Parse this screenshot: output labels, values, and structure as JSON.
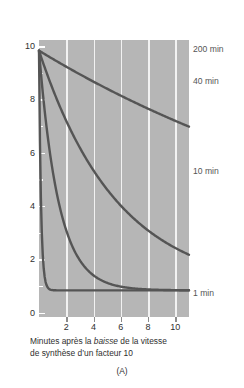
{
  "chart_data": {
    "type": "line",
    "title": "",
    "subtitle": "",
    "panel_letter": "(A)",
    "xlabel_line1_pre": "Minutes après la ",
    "xlabel_line1_emph": "baisse",
    "xlabel_line1_post": " de la vitesse",
    "xlabel_line2": "de synthèse d’un facteur 10",
    "xlabel_full": "Minutes après la baisse de la vitesse de synthèse d’un facteur 10",
    "ylabel": "Concentration relative des molécules intracellulaires",
    "xlim": [
      0,
      11
    ],
    "ylim": [
      0,
      10.4
    ],
    "x_ticks": [
      2,
      4,
      6,
      8,
      10
    ],
    "x_tick_labels": [
      "2",
      "4",
      "6",
      "8",
      "10"
    ],
    "y_ticks": [
      0,
      2,
      4,
      6,
      8,
      10
    ],
    "y_tick_labels": [
      "0",
      "2",
      "4",
      "6",
      "8",
      "10"
    ],
    "y_minor_ticks": [
      1,
      3,
      5,
      7,
      9
    ],
    "grid": "vertical",
    "grid_color": "#f2f2f2",
    "plot_background": "#b6b6b6",
    "line_color": "#555555",
    "legend_position": "right-inline-annotations",
    "x": [
      0,
      0.25,
      0.5,
      0.75,
      1,
      1.5,
      2,
      2.5,
      3,
      3.5,
      4,
      5,
      6,
      7,
      8,
      9,
      10,
      11
    ],
    "series": [
      {
        "name": "200 min",
        "label": "200 min",
        "half_life_min": 200,
        "end_value": 9.65,
        "values": [
          10,
          9.99,
          9.98,
          9.97,
          9.96,
          9.95,
          9.93,
          9.91,
          9.9,
          9.88,
          9.86,
          9.83,
          9.8,
          9.77,
          9.74,
          9.71,
          9.68,
          9.65
        ]
      },
      {
        "name": "40 min",
        "label": "40 min",
        "half_life_min": 40,
        "end_value": 8.45,
        "values": [
          10,
          9.96,
          9.92,
          9.87,
          9.83,
          9.74,
          9.66,
          9.57,
          9.49,
          9.4,
          9.32,
          9.15,
          8.98,
          8.81,
          8.64,
          8.56,
          8.5,
          8.45
        ]
      },
      {
        "name": "10 min",
        "label": "10 min",
        "half_life_min": 10,
        "end_value": 5.5,
        "values": [
          10,
          9.85,
          9.7,
          9.55,
          9.4,
          9.11,
          8.83,
          8.56,
          8.3,
          8.05,
          7.8,
          7.35,
          6.92,
          6.55,
          6.2,
          5.95,
          5.72,
          5.5
        ]
      },
      {
        "name": "1 min",
        "label": "1 min",
        "half_life_min": 1,
        "end_value": 1.05,
        "values": [
          10,
          8.2,
          6.8,
          5.7,
          4.8,
          3.55,
          2.8,
          2.3,
          2.0,
          1.75,
          1.6,
          1.35,
          1.2,
          1.12,
          1.08,
          1.06,
          1.05,
          1.05
        ]
      }
    ]
  }
}
